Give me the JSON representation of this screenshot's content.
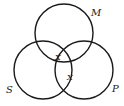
{
  "diagram": {
    "type": "venn",
    "circles": [
      {
        "id": "M",
        "label": "M",
        "cx": 64,
        "cy": 33,
        "r": 29,
        "label_x": 91,
        "label_y": 16
      },
      {
        "id": "S",
        "label": "S",
        "cx": 43,
        "cy": 70,
        "r": 29,
        "label_x": 6,
        "label_y": 93
      },
      {
        "id": "P",
        "label": "P",
        "cx": 84,
        "cy": 70,
        "r": 29,
        "label_x": 112,
        "label_y": 92
      }
    ],
    "marks": [
      {
        "text": "X",
        "x": 55,
        "y": 60,
        "region": "M∩S∩P (upper)"
      },
      {
        "text": "X",
        "x": 67,
        "y": 80,
        "region": "S∩P"
      }
    ],
    "stroke_color": "#1a1a1a",
    "background": "#ffffff"
  }
}
